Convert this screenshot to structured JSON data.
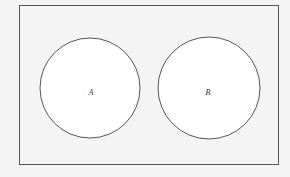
{
  "diagram": {
    "type": "venn",
    "universe": {
      "x": 19,
      "y": 5,
      "width": 260,
      "height": 160
    },
    "sets": [
      {
        "label": "A",
        "cx": 90,
        "cy": 88,
        "r": 50
      },
      {
        "label": "B",
        "cx": 209,
        "cy": 88,
        "r": 51
      }
    ],
    "stroke_color": "#555555",
    "fill_color": "#ffffff",
    "background_color": "#f4f4f4"
  }
}
